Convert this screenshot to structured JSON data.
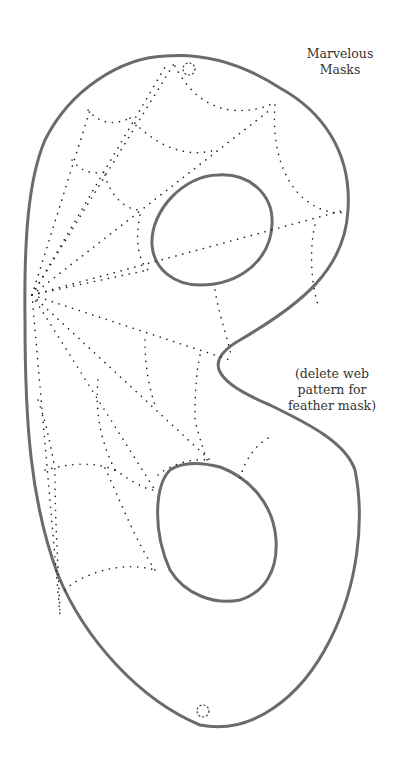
{
  "title": {
    "line1": "Marvelous",
    "line2": "Masks"
  },
  "note": {
    "line1": "(delete web",
    "line2": "pattern for",
    "line3": "feather mask)"
  },
  "colors": {
    "outline": "#6b6b6b",
    "web_dots": "#222222",
    "background": "#ffffff"
  },
  "elements": {
    "outline": "mask-outline",
    "eye_holes": [
      "upper-eye-hole",
      "lower-eye-hole"
    ],
    "tie_holes": [
      "top-tie-hole",
      "bottom-tie-hole"
    ],
    "pattern": "spider-web-dotted-pattern"
  }
}
